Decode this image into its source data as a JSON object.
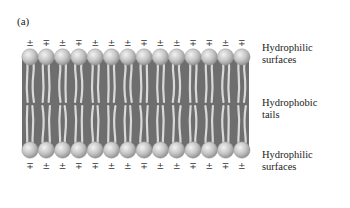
{
  "figure": {
    "panel_label": "(a)",
    "top_charges": [
      "±",
      "∓",
      "±",
      "∓",
      "±",
      "±",
      "±",
      "∓",
      "±",
      "±",
      "∓",
      "∓",
      "±",
      "∓"
    ],
    "bottom_charges": [
      "∓",
      "±",
      "±",
      "∓",
      "∓",
      "±",
      "±",
      "∓",
      "±",
      "±",
      "∓",
      "±",
      "∓",
      "±"
    ],
    "labels": {
      "top": [
        "Hydrophilic",
        "surfaces"
      ],
      "middle": [
        "Hydrophobic",
        "tails"
      ],
      "bottom": [
        "Hydrophilic",
        "surfaces"
      ]
    },
    "colors": {
      "membrane_core": "#6e6e6e",
      "head_light": "#e6e6e6",
      "head_dark": "#9a9a9a",
      "tail": "#d9d9d9"
    },
    "head_count_per_leaflet": 14
  }
}
